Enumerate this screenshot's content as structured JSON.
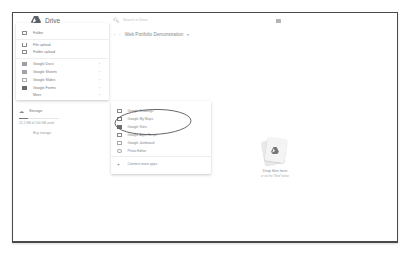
{
  "app": {
    "name": "Drive",
    "brand_color": "#5f6368"
  },
  "search": {
    "placeholder": "Search in Drive",
    "icon": "search-icon"
  },
  "header": {
    "right_icon": "grid-view-icon"
  },
  "breadcrumb": {
    "items": [
      "Web Portfolio Demonstration"
    ],
    "dropdown_icon": "chevron-down-icon"
  },
  "new_menu": {
    "items": [
      {
        "label": "Folder",
        "icon": "folder-icon"
      },
      {
        "label": "File upload",
        "icon": "file-upload-icon"
      },
      {
        "label": "Folder upload",
        "icon": "folder-upload-icon"
      },
      {
        "label": "Google Docs",
        "icon": "docs-icon",
        "has_submenu": true
      },
      {
        "label": "Google Sheets",
        "icon": "sheets-icon",
        "has_submenu": true
      },
      {
        "label": "Google Slides",
        "icon": "slides-icon",
        "has_submenu": true
      },
      {
        "label": "Google Forms",
        "icon": "forms-icon",
        "has_submenu": true
      },
      {
        "label": "More",
        "icon": "",
        "has_submenu": true
      }
    ]
  },
  "storage": {
    "label": "Storage",
    "usage_text": "22.2 GB of 100 GB used",
    "used_percent": 22,
    "buy_label": "Buy storage"
  },
  "more_menu": {
    "items": [
      {
        "label": "Google Drawings",
        "icon": "drawings-icon"
      },
      {
        "label": "Google My Maps",
        "icon": "my-maps-icon"
      },
      {
        "label": "Google Sites",
        "icon": "sites-icon"
      },
      {
        "label": "Google Apps Script",
        "icon": "apps-script-icon"
      },
      {
        "label": "Google Jamboard",
        "icon": "jamboard-icon"
      },
      {
        "label": "Photo Editor",
        "icon": "photo-editor-icon"
      },
      {
        "label": "Connect more apps",
        "icon": "plus-icon"
      }
    ],
    "plus_glyph": "+"
  },
  "empty_state": {
    "title": "Drop files here",
    "subtitle": "or use the \"New\" button"
  },
  "glyphs": {
    "chevron_right": "›",
    "chevron_left": "‹",
    "chevron_down": "▾",
    "search": "🔍︎",
    "cloud": "☁"
  }
}
